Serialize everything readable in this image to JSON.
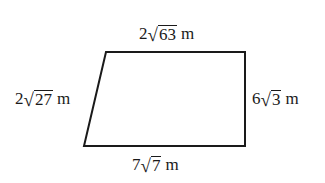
{
  "figure": {
    "type": "quadrilateral",
    "stroke_color": "#1a1a1a",
    "background": "#ffffff",
    "vertices": {
      "top_left": [
        106,
        52
      ],
      "top_right": [
        245,
        52
      ],
      "bottom_right": [
        245,
        146
      ],
      "bottom_left": [
        84,
        146
      ]
    }
  },
  "labels": {
    "top": {
      "coefficient": "2",
      "radicand": "63",
      "unit": "m"
    },
    "left": {
      "coefficient": "2",
      "radicand": "27",
      "unit": "m"
    },
    "right": {
      "coefficient": "6",
      "radicand": "3",
      "unit": "m"
    },
    "bottom": {
      "coefficient": "7",
      "radicand": "7",
      "unit": "m"
    }
  },
  "symbols": {
    "radical": "√"
  }
}
